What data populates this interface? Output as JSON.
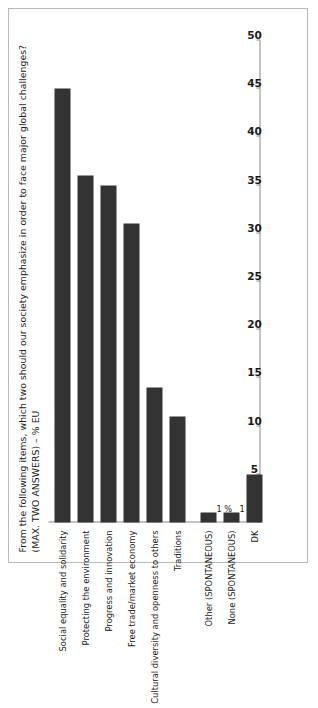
{
  "chart_data": {
    "type": "bar",
    "orientation": "vertical-rotated",
    "title": "From the following items, which two should our society emphasize in order to face major global challenges? (MAX. TWO ANSWERS) – % EU",
    "xlabel": "",
    "ylabel": "",
    "ylim": [
      0,
      50
    ],
    "ytick_step": 5,
    "grid": false,
    "legend": "none",
    "bar_color": "#333333",
    "axis_color": "#8a8a8a",
    "tick_labels": [
      "0",
      "5",
      "10",
      "15",
      "20",
      "25",
      "30",
      "35",
      "40",
      "45",
      "50"
    ],
    "categories": [
      "Social equality and solidarity",
      "Protecting the environment",
      "Progress and innovation",
      "Free trade/market economy",
      "Cultural diversity and openness to others",
      "Traditions",
      "Other (SPONTANEOUS)",
      "None (SPONTANEOUS)",
      "DK"
    ],
    "values": [
      45,
      36,
      35,
      31,
      14,
      11,
      1,
      1,
      5
    ],
    "data_labels": [
      "",
      "",
      "",
      "",
      "",
      "",
      "1 %",
      "1 %",
      ""
    ]
  }
}
